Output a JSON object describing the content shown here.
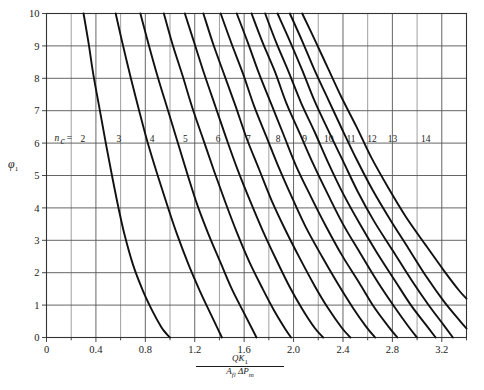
{
  "chart_data": {
    "type": "line",
    "title": "",
    "xlabel": "QK1 / (Afl ΔPm)",
    "ylabel": "φ1",
    "xlim": [
      0,
      3.4
    ],
    "ylim": [
      0,
      10
    ],
    "grid": true,
    "legend_position": "inline-curve-labels",
    "x_major_ticks": [
      0,
      0.4,
      0.8,
      1.2,
      1.6,
      2.0,
      2.4,
      2.8,
      3.2
    ],
    "x_major_tick_labels": [
      "0",
      "0.4",
      "0.8",
      "1.2",
      "1.6",
      "2.0",
      "2.4",
      "2.8",
      "3.2"
    ],
    "x_minor_tick_step": 0.2,
    "y_major_ticks": [
      0,
      1,
      2,
      3,
      4,
      5,
      6,
      7,
      8,
      9,
      10
    ],
    "y_major_tick_labels": [
      "0",
      "1",
      "2",
      "3",
      "4",
      "5",
      "6",
      "7",
      "8",
      "9",
      "10"
    ],
    "family_label": "nc =",
    "family_label_symbol": "n",
    "family_label_subscript": "c",
    "family_label_equals": "=",
    "curve_label_y_value": 6,
    "series": [
      {
        "name": "2",
        "label": "2",
        "x_at_y0": 1.0,
        "x_at_y10": 0.3,
        "x": [
          0.3,
          0.34,
          0.38,
          0.43,
          0.48,
          0.53,
          0.58,
          0.63,
          0.7,
          0.78,
          0.86,
          0.93,
          0.97,
          1.0
        ],
        "y": [
          10.0,
          9.1,
          8.1,
          7.05,
          6.0,
          5.0,
          4.05,
          3.2,
          2.25,
          1.45,
          0.8,
          0.32,
          0.12,
          0.0
        ]
      },
      {
        "name": "3",
        "label": "3",
        "x_at_y0": 1.42,
        "x_at_y10": 0.56,
        "x": [
          0.56,
          0.62,
          0.68,
          0.75,
          0.82,
          0.9,
          0.98,
          1.06,
          1.15,
          1.24,
          1.32,
          1.38,
          1.42
        ],
        "y": [
          10.0,
          9.0,
          8.05,
          7.0,
          6.0,
          5.0,
          4.05,
          3.15,
          2.25,
          1.45,
          0.8,
          0.32,
          0.0
        ]
      },
      {
        "name": "4",
        "label": "4",
        "x_at_y0": 1.7,
        "x_at_y10": 0.76,
        "x": [
          0.76,
          0.83,
          0.9,
          0.98,
          1.06,
          1.14,
          1.22,
          1.31,
          1.41,
          1.5,
          1.59,
          1.66,
          1.7
        ],
        "y": [
          10.0,
          9.0,
          8.05,
          7.05,
          6.05,
          5.05,
          4.1,
          3.2,
          2.3,
          1.5,
          0.82,
          0.3,
          0.0
        ]
      },
      {
        "name": "5",
        "label": "5",
        "x_at_y0": 1.98,
        "x_at_y10": 0.95,
        "x": [
          0.95,
          1.02,
          1.1,
          1.18,
          1.27,
          1.36,
          1.45,
          1.54,
          1.64,
          1.75,
          1.84,
          1.93,
          1.98
        ],
        "y": [
          10.0,
          9.05,
          8.1,
          7.1,
          6.1,
          5.1,
          4.15,
          3.25,
          2.35,
          1.5,
          0.85,
          0.28,
          0.0
        ]
      },
      {
        "name": "6",
        "label": "6",
        "x_at_y0": 2.24,
        "x_at_y10": 1.12,
        "x": [
          1.12,
          1.2,
          1.28,
          1.37,
          1.46,
          1.55,
          1.65,
          1.75,
          1.86,
          1.97,
          2.07,
          2.17,
          2.24
        ],
        "y": [
          10.0,
          9.05,
          8.1,
          7.1,
          6.1,
          5.15,
          4.2,
          3.3,
          2.4,
          1.55,
          0.88,
          0.3,
          0.0
        ]
      },
      {
        "name": "7",
        "label": "7",
        "x_at_y0": 2.46,
        "x_at_y10": 1.27,
        "x": [
          1.27,
          1.35,
          1.44,
          1.53,
          1.62,
          1.72,
          1.82,
          1.93,
          2.05,
          2.17,
          2.28,
          2.39,
          2.46
        ],
        "y": [
          10.0,
          9.05,
          8.1,
          7.15,
          6.15,
          5.2,
          4.25,
          3.35,
          2.45,
          1.6,
          0.9,
          0.3,
          0.0
        ]
      },
      {
        "name": "8",
        "label": "8",
        "x_at_y0": 2.66,
        "x_at_y10": 1.41,
        "x": [
          1.41,
          1.5,
          1.59,
          1.68,
          1.78,
          1.88,
          1.99,
          2.1,
          2.23,
          2.36,
          2.48,
          2.59,
          2.66
        ],
        "y": [
          10.0,
          9.05,
          8.15,
          7.15,
          6.2,
          5.25,
          4.3,
          3.4,
          2.5,
          1.65,
          0.92,
          0.32,
          0.0
        ]
      },
      {
        "name": "9",
        "label": "9",
        "x_at_y0": 2.84,
        "x_at_y10": 1.54,
        "x": [
          1.54,
          1.63,
          1.72,
          1.82,
          1.92,
          2.02,
          2.14,
          2.26,
          2.39,
          2.53,
          2.65,
          2.77,
          2.84
        ],
        "y": [
          10.0,
          9.1,
          8.15,
          7.2,
          6.25,
          5.3,
          4.35,
          3.45,
          2.55,
          1.7,
          0.95,
          0.33,
          0.0
        ]
      },
      {
        "name": "10",
        "label": "10",
        "x_at_y0": 3.0,
        "x_at_y10": 1.66,
        "x": [
          1.66,
          1.75,
          1.85,
          1.94,
          2.05,
          2.16,
          2.28,
          2.4,
          2.54,
          2.68,
          2.81,
          2.93,
          3.0
        ],
        "y": [
          10.0,
          9.1,
          8.2,
          7.25,
          6.3,
          5.35,
          4.4,
          3.5,
          2.6,
          1.72,
          0.98,
          0.34,
          0.0
        ]
      },
      {
        "name": "11",
        "label": "11",
        "x_at_y0": 3.15,
        "x_at_y10": 1.77,
        "x": [
          1.77,
          1.86,
          1.96,
          2.06,
          2.17,
          2.28,
          2.4,
          2.53,
          2.67,
          2.82,
          2.95,
          3.08,
          3.15
        ],
        "y": [
          10.0,
          9.1,
          8.2,
          7.25,
          6.35,
          5.4,
          4.45,
          3.55,
          2.65,
          1.76,
          1.0,
          0.35,
          0.0
        ]
      },
      {
        "name": "12",
        "label": "12",
        "x_at_y0": 3.29,
        "x_at_y10": 1.87,
        "x": [
          1.87,
          1.97,
          2.07,
          2.17,
          2.28,
          2.4,
          2.52,
          2.65,
          2.8,
          2.95,
          3.09,
          3.22,
          3.29
        ],
        "y": [
          10.0,
          9.15,
          8.25,
          7.3,
          6.4,
          5.45,
          4.5,
          3.6,
          2.7,
          1.8,
          1.02,
          0.36,
          0.0
        ]
      },
      {
        "name": "13",
        "label": "13",
        "x_at_y0": 3.4,
        "x_at_y10": 1.97,
        "x": [
          1.97,
          2.07,
          2.17,
          2.28,
          2.39,
          2.51,
          2.64,
          2.78,
          2.93,
          3.08,
          3.22,
          3.35,
          3.4
        ],
        "y": [
          10.0,
          9.15,
          8.25,
          7.35,
          6.45,
          5.5,
          4.55,
          3.65,
          2.75,
          1.85,
          1.1,
          0.5,
          0.28
        ]
      },
      {
        "name": "14",
        "label": "14",
        "x_at_y0": null,
        "x_at_y10": 2.07,
        "x": [
          2.07,
          2.17,
          2.28,
          2.39,
          2.51,
          2.63,
          2.77,
          2.91,
          3.07,
          3.22,
          3.34,
          3.4
        ],
        "y": [
          10.0,
          9.2,
          8.3,
          7.4,
          6.5,
          5.55,
          4.6,
          3.72,
          2.85,
          2.05,
          1.45,
          1.2
        ]
      }
    ],
    "curve_label_x_positions": [
      0.295,
      0.585,
      0.855,
      1.125,
      1.39,
      1.635,
      1.875,
      2.09,
      2.285,
      2.465,
      2.635,
      2.8,
      3.07
    ]
  },
  "axis": {
    "y_title_base": "φ",
    "y_title_sub": "1",
    "x_title_numer_main": "QK",
    "x_title_numer_sub": "1",
    "x_title_denom_a": "A",
    "x_title_denom_a_sub": "fl",
    "x_title_denom_delta": "ΔP",
    "x_title_denom_delta_sub": "m"
  },
  "colors": {
    "curve": "#111111",
    "grid_major": "#555555",
    "grid_minor": "#777777",
    "frame": "#333333",
    "background": "#ffffff",
    "text": "#1a1a1a"
  }
}
